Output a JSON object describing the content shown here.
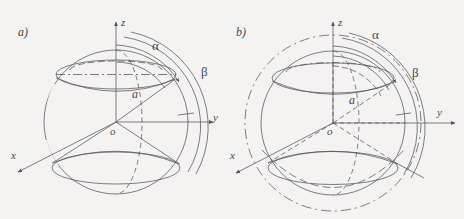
{
  "figure": {
    "background_color": "#f4f3f1",
    "stroke_color": "#55545a",
    "panels": [
      {
        "id": "a",
        "panel_label": "a)",
        "center": {
          "x": 116,
          "y": 122
        },
        "sphere_radius": 72,
        "axes": [
          {
            "name": "z",
            "label": "z",
            "direction": "up"
          },
          {
            "name": "y",
            "label": "y",
            "direction": "right"
          },
          {
            "name": "x",
            "label": "x",
            "direction": "down-left"
          }
        ],
        "radius_label": "a",
        "origin_label": "o",
        "angle_labels": [
          {
            "name": "alpha",
            "label": "α"
          },
          {
            "name": "beta",
            "label": "β"
          }
        ],
        "outer_circle": false
      },
      {
        "id": "b",
        "panel_label": "b)",
        "center": {
          "x": 333,
          "y": 123
        },
        "sphere_radius": 72,
        "outer_radius": 88,
        "axes": [
          {
            "name": "z",
            "label": "z",
            "direction": "up"
          },
          {
            "name": "y",
            "label": "y",
            "direction": "right"
          },
          {
            "name": "x",
            "label": "x",
            "direction": "down-left"
          }
        ],
        "radius_label": "a",
        "origin_label": "o",
        "angle_labels": [
          {
            "name": "alpha",
            "label": "α"
          },
          {
            "name": "beta",
            "label": "β"
          }
        ],
        "outer_circle": true
      }
    ]
  },
  "labels": {
    "panel_a": "a)",
    "panel_b": "b)",
    "z_axis_a": "z",
    "y_axis_a": "y",
    "x_axis_a": "x",
    "alpha_a": "α",
    "beta_a": "β",
    "radius_a": "a",
    "origin_a": "o",
    "z_axis_b": "z",
    "y_axis_b": "y",
    "x_axis_b": "x",
    "alpha_b": "α",
    "beta_b": "β",
    "radius_b": "a",
    "origin_b": "o"
  }
}
